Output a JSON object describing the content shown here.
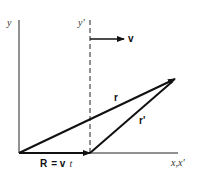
{
  "diagram": {
    "labels": {
      "y_axis": "y",
      "y_prime_axis": "y'",
      "x_axis": "x,x'",
      "velocity": "v",
      "r_vector": "r",
      "r_prime_vector": "r'",
      "R_eq_bold": "R",
      "R_eq_rest": "= v",
      "R_eq_t": "t"
    }
  }
}
